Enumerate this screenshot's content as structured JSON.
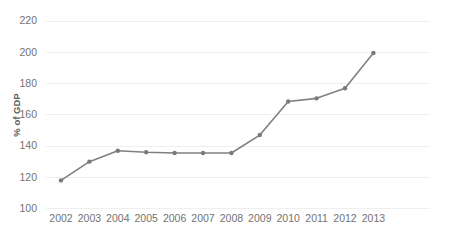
{
  "chart_data": {
    "type": "line",
    "title": "",
    "subtitle": "",
    "xlabel": "",
    "ylabel": "% of GDP",
    "categories": [
      "2002",
      "2003",
      "2004",
      "2005",
      "2006",
      "2007",
      "2008",
      "2009",
      "2010",
      "2011",
      "2012",
      "2013"
    ],
    "x": [
      2002,
      2003,
      2004,
      2005,
      2006,
      2007,
      2008,
      2009,
      2010,
      2011,
      2012,
      2013
    ],
    "values": [
      118,
      130,
      137,
      136,
      135.5,
      135.5,
      135.5,
      147,
      168.5,
      170.5,
      177,
      199.5
    ],
    "series": [
      {
        "name": "% of GDP",
        "values": [
          118,
          130,
          137,
          136,
          135.5,
          135.5,
          135.5,
          147,
          168.5,
          170.5,
          177,
          199.5
        ]
      }
    ],
    "ylim": [
      100,
      220
    ],
    "ytick_labels": [
      "100",
      "120",
      "140",
      "160",
      "180",
      "200",
      "220"
    ],
    "ytick_values": [
      100,
      120,
      140,
      160,
      180,
      200,
      220
    ],
    "ytick_step": 20,
    "grid": true,
    "grid_axis": "y",
    "legend": false,
    "legend_position": "none",
    "marker": "circle",
    "annotations": []
  },
  "style": {
    "line_color": "#808080",
    "marker_color": "#7a7a7a",
    "grid_color": "#efefef",
    "text_color": "#737373",
    "axis_title_color": "#5e5e5e",
    "background": "#ffffff",
    "line_width": 1.6,
    "marker_radius": 2.2
  },
  "geometry": {
    "plot_left": 46,
    "plot_right": 430,
    "plot_top": 21,
    "plot_bottom": 208.5,
    "x_first": 61,
    "x_step": 28.4,
    "y_axis_title_x": 20,
    "y_axis_title_y": 115,
    "xtick_label_y": 222
  }
}
